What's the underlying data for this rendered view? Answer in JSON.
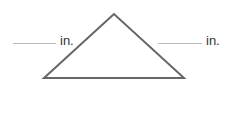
{
  "diagram": {
    "shape": "triangle",
    "vertices": {
      "apex": [
        114,
        14
      ],
      "bottom_left": [
        44,
        78
      ],
      "bottom_right": [
        184,
        78
      ]
    },
    "stroke_color": "#666666",
    "left_label": {
      "blank": "",
      "unit": "in."
    },
    "right_label": {
      "blank": "",
      "unit": "in."
    }
  }
}
